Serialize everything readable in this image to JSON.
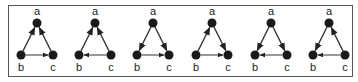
{
  "figure": {
    "node_labels": {
      "a": "a",
      "b": "b",
      "c": "c"
    },
    "colors": {
      "edge": "#333333",
      "node": "#1a1a1a",
      "frame": "#555555",
      "background": "#ffffff"
    },
    "graphs": [
      {
        "index": 1,
        "edges": [
          [
            "b",
            "a"
          ],
          [
            "c",
            "a"
          ],
          [
            "b",
            "c"
          ]
        ]
      },
      {
        "index": 2,
        "edges": [
          [
            "b",
            "a"
          ],
          [
            "c",
            "a"
          ],
          [
            "c",
            "b"
          ]
        ]
      },
      {
        "index": 3,
        "edges": [
          [
            "a",
            "b"
          ],
          [
            "a",
            "c"
          ],
          [
            "b",
            "c"
          ]
        ]
      },
      {
        "index": 4,
        "edges": [
          [
            "b",
            "a"
          ],
          [
            "a",
            "c"
          ],
          [
            "b",
            "c"
          ]
        ]
      },
      {
        "index": 5,
        "edges": [
          [
            "a",
            "b"
          ],
          [
            "a",
            "c"
          ],
          [
            "c",
            "b"
          ]
        ]
      },
      {
        "index": 6,
        "edges": [
          [
            "a",
            "b"
          ],
          [
            "c",
            "a"
          ],
          [
            "c",
            "b"
          ]
        ]
      }
    ]
  }
}
